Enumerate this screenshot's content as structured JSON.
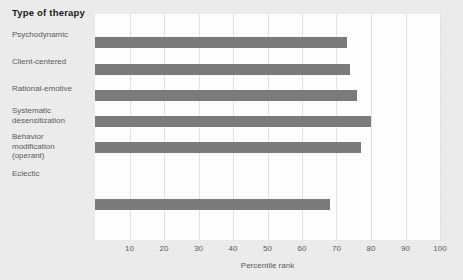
{
  "chart_data": {
    "type": "bar",
    "orientation": "horizontal",
    "title": "Type of therapy",
    "xlabel": "Percentile rank",
    "ylabel": "Type of therapy",
    "categories": [
      "Psychodynamic",
      "Client-centered",
      "Rational-emotive",
      "Systematic\ndesensitization",
      "Behavior\nmodification\n(operant)",
      "Eclectic"
    ],
    "values": [
      73,
      74,
      76,
      80,
      77,
      68
    ],
    "xlim": [
      0,
      100
    ],
    "xticks": [
      10,
      20,
      30,
      40,
      50,
      60,
      70,
      80,
      90,
      100
    ],
    "xtick_labels": [
      "10",
      "20",
      "30",
      "40",
      "50",
      "60",
      "70",
      "80",
      "90",
      "100"
    ],
    "grid": "vertical",
    "legend": null,
    "bar_color": "#7b7b7d",
    "plot_background": "#fefefe",
    "figure_background": "#ececed",
    "text_color": "#5a5a5c",
    "title_color": "#19191b",
    "gridline_color": "#e2e2e3"
  }
}
